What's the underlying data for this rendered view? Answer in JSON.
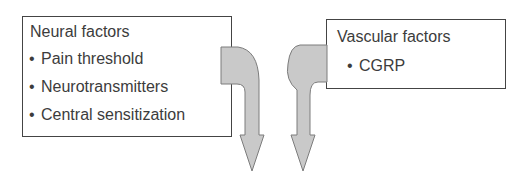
{
  "diagram": {
    "neural_box": {
      "title": "Neural factors",
      "items": [
        {
          "bullet": "•",
          "label": "Pain threshold"
        },
        {
          "bullet": "•",
          "label": "Neurotransmitters"
        },
        {
          "bullet": "•",
          "label": "Central sensitization"
        }
      ]
    },
    "vascular_box": {
      "title": "Vascular factors",
      "items": [
        {
          "bullet": "•",
          "label": "CGRP"
        }
      ]
    },
    "arrows": [
      {
        "from": "Neural factors",
        "direction": "down",
        "fill": "#c8c8c8",
        "stroke": "#7a7a7a"
      },
      {
        "from": "Vascular factors",
        "direction": "down",
        "fill": "#c8c8c8",
        "stroke": "#7a7a7a"
      }
    ]
  }
}
